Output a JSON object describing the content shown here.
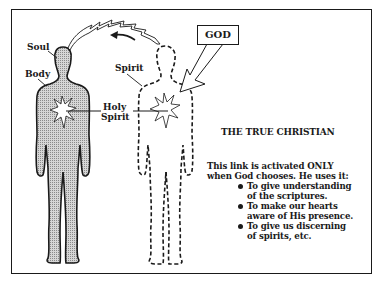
{
  "diagram": {
    "title": "THE TRUE CHRISTIAN",
    "labels": {
      "soul": "Soul",
      "body": "Body",
      "spirit": "Spirit",
      "holy_spirit_line1": "Holy",
      "holy_spirit_line2": "Spirit",
      "god": "GOD"
    },
    "description": {
      "line1": "This link is activated ONLY",
      "line2": "when God chooses. He uses it:",
      "bullets": [
        {
          "line1": "To give understanding",
          "line2": "of the scriptures."
        },
        {
          "line1": "To make our hearts",
          "line2": "aware of His presence."
        },
        {
          "line1": "To give us discerning",
          "line2": "of spirits, etc."
        }
      ]
    },
    "figures": [
      {
        "name": "body-figure",
        "style": "solid-stippled"
      },
      {
        "name": "spirit-figure",
        "style": "dashed-outline"
      }
    ],
    "colors": {
      "ink": "#1a1a1a",
      "stipple": "#b8b8b8",
      "background": "#ffffff"
    }
  }
}
